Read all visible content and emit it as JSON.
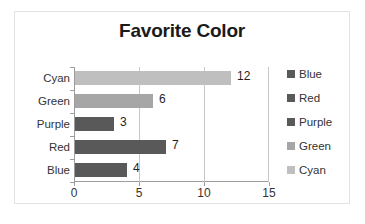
{
  "chart_data": {
    "type": "bar",
    "orientation": "horizontal",
    "title": "Favorite Color",
    "xlabel": "",
    "ylabel": "",
    "categories": [
      "Blue",
      "Red",
      "Purple",
      "Green",
      "Cyan"
    ],
    "values": [
      4,
      7,
      3,
      6,
      12
    ],
    "data_labels": [
      "4",
      "7",
      "3",
      "6",
      "12"
    ],
    "bar_colors": [
      "#595959",
      "#595959",
      "#595959",
      "#a6a6a6",
      "#bfbfbf"
    ],
    "xlim": [
      0,
      15
    ],
    "xticks": [
      0,
      5,
      10,
      15
    ],
    "xtick_labels": [
      "0",
      "5",
      "10",
      "15"
    ],
    "gridlines": [
      5,
      10
    ],
    "grid": true,
    "legend": {
      "position": "right",
      "entries": [
        {
          "label": "Blue",
          "color": "#595959"
        },
        {
          "label": "Red",
          "color": "#595959"
        },
        {
          "label": "Purple",
          "color": "#595959"
        },
        {
          "label": "Green",
          "color": "#a6a6a6"
        },
        {
          "label": "Cyan",
          "color": "#bfbfbf"
        }
      ]
    },
    "axis_color": "#9c9c9c",
    "grid_color": "#c8c8c8",
    "border_color": "#e3e3e3",
    "background": "#ffffff"
  }
}
